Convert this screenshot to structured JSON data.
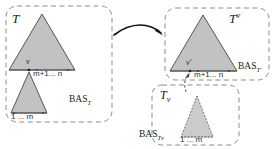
{
  "figure": {
    "type": "diagram",
    "colors": {
      "triangle_fill": "#c2c2c2",
      "triangle_fill_light": "#cccccc",
      "stroke": "#4d4d4d",
      "dashed_border": "#8c8c8c",
      "text": "#1a1a1a",
      "background": "#ffffff"
    }
  },
  "panels": {
    "source": {
      "title_base": "T",
      "title_script": "",
      "bas_base": "BAS",
      "bas_sub": "T",
      "node_label": "v",
      "upper_leaf_range": "m+1... n",
      "lower_leaf_range": "1 ... m"
    },
    "target_upper": {
      "title_base": "T",
      "title_script": "v",
      "script_kind": "superscript",
      "bas_base": "BAS",
      "bas_sub": "T′",
      "node_label": "v′",
      "upper_leaf_range": "m+1... n"
    },
    "target_lower": {
      "title_base": "T",
      "title_script": "v",
      "script_kind": "subscript",
      "bas_base": "BAS",
      "bas_sub": "Tv",
      "lower_leaf_range": "1 ... m"
    }
  },
  "arrows": {
    "main": {
      "name": "transform-arrow",
      "style": "solid-curved"
    },
    "attach": {
      "name": "attach-arrow",
      "style": "dashed-curved"
    }
  }
}
